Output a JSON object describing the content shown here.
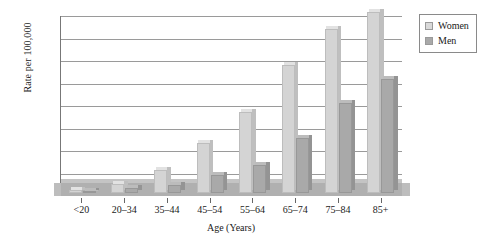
{
  "chart_data": {
    "type": "bar",
    "title": "",
    "xlabel": "Age (Years)",
    "ylabel": "Rate per 100,000",
    "ylim": [
      0,
      40
    ],
    "ytick_step": 5,
    "yticks": [
      "0",
      "5",
      "10",
      "15",
      "20",
      "25",
      "30",
      "35",
      "40"
    ],
    "grid": true,
    "legend_position": "top-right-outside",
    "categories": [
      "<20",
      "20–34",
      "35–44",
      "45–54",
      "55–64",
      "65–74",
      "75–84",
      "85+"
    ],
    "series": [
      {
        "name": "Women",
        "color": "#d4d4d4",
        "values": [
          0.6,
          1.9,
          5.1,
          11.2,
          18.1,
          28.4,
          36.5,
          40.3
        ]
      },
      {
        "name": "Men",
        "color": "#a9a9a9",
        "values": [
          0.5,
          1.2,
          1.7,
          4.1,
          6.2,
          12.3,
          19.9,
          25.3
        ]
      }
    ],
    "floor_value": 3.0
  },
  "legend": {
    "items": [
      {
        "label": "Women"
      },
      {
        "label": "Men"
      }
    ]
  }
}
